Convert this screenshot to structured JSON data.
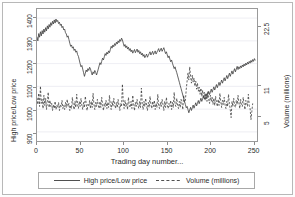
{
  "chart_data": {
    "type": "line",
    "title": "",
    "xlabel": "Trading day number...",
    "ylabel": "High price/Low price",
    "y2label": "Volume (millions)",
    "xlim": [
      0,
      255
    ],
    "ylim": [
      860,
      1440
    ],
    "y2lim": [
      0,
      26
    ],
    "grid": true,
    "grid_axis": "y",
    "legend_position": "bottom",
    "xticks": [
      "0",
      "50",
      "100",
      "150",
      "200",
      "250"
    ],
    "xtick_values": [
      0,
      50,
      100,
      150,
      200,
      250
    ],
    "yticks": [
      "900",
      "1000",
      "1100",
      "1200",
      "1300",
      "1400"
    ],
    "ytick_values": [
      900,
      1000,
      1100,
      1200,
      1300,
      1400
    ],
    "y2ticks": [
      "5",
      "11",
      "22.5"
    ],
    "y2tick_values": [
      5,
      11,
      22.5
    ],
    "series": [
      {
        "name": "High price/Low price",
        "axis": "left",
        "style": "solid",
        "color": "#3c3c3c",
        "values": [
          1318,
          1300,
          1332,
          1316,
          1340,
          1322,
          1345,
          1330,
          1352,
          1338,
          1358,
          1344,
          1366,
          1352,
          1372,
          1360,
          1380,
          1368,
          1386,
          1374,
          1392,
          1378,
          1396,
          1384,
          1390,
          1376,
          1382,
          1368,
          1374,
          1358,
          1364,
          1348,
          1352,
          1336,
          1330,
          1316,
          1322,
          1306,
          1290,
          1276,
          1282,
          1268,
          1274,
          1258,
          1264,
          1250,
          1256,
          1240,
          1232,
          1216,
          1200,
          1186,
          1192,
          1176,
          1160,
          1144,
          1158,
          1172,
          1164,
          1178,
          1170,
          1184,
          1176,
          1162,
          1150,
          1164,
          1156,
          1170,
          1162,
          1150,
          1162,
          1176,
          1190,
          1204,
          1196,
          1210,
          1224,
          1216,
          1230,
          1244,
          1236,
          1250,
          1242,
          1256,
          1248,
          1262,
          1276,
          1268,
          1282,
          1274,
          1288,
          1280,
          1294,
          1286,
          1300,
          1292,
          1306,
          1298,
          1312,
          1304,
          1290,
          1276,
          1284,
          1270,
          1278,
          1264,
          1272,
          1258,
          1266,
          1252,
          1260,
          1246,
          1254,
          1262,
          1248,
          1256,
          1264,
          1250,
          1258,
          1244,
          1252,
          1238,
          1246,
          1232,
          1240,
          1226,
          1234,
          1242,
          1228,
          1236,
          1244,
          1252,
          1238,
          1246,
          1254,
          1240,
          1248,
          1256,
          1242,
          1250,
          1258,
          1266,
          1252,
          1260,
          1268,
          1254,
          1262,
          1270,
          1256,
          1244,
          1252,
          1238,
          1226,
          1234,
          1220,
          1208,
          1216,
          1202,
          1190,
          1178,
          1186,
          1172,
          1160,
          1146,
          1132,
          1118,
          1104,
          1090,
          1076,
          1062,
          1048,
          1034,
          1020,
          1006,
          1012,
          998,
          984,
          996,
          1008,
          994,
          1006,
          1018,
          1004,
          1016,
          1028,
          1014,
          1026,
          1038,
          1024,
          1036,
          1048,
          1034,
          1046,
          1058,
          1044,
          1056,
          1068,
          1054,
          1066,
          1078,
          1064,
          1076,
          1088,
          1074,
          1086,
          1098,
          1084,
          1096,
          1108,
          1094,
          1106,
          1118,
          1104,
          1116,
          1128,
          1114,
          1126,
          1138,
          1124,
          1136,
          1148,
          1134,
          1146,
          1158,
          1144,
          1156,
          1168,
          1154,
          1166,
          1178,
          1164,
          1176,
          1188,
          1174,
          1186,
          1178,
          1190,
          1182,
          1194,
          1186,
          1198,
          1190,
          1202,
          1194,
          1206,
          1198,
          1210,
          1202,
          1214,
          1206,
          1218,
          1210,
          1222,
          1214
        ]
      },
      {
        "name": "Volume (millions)",
        "axis": "right",
        "style": "dashed",
        "color": "#3c3c3c",
        "values": [
          8.5,
          7.2,
          9.4,
          6.8,
          10.8,
          7.4,
          8.2,
          6.4,
          9.0,
          7.0,
          8.4,
          6.2,
          7.8,
          9.6,
          6.6,
          8.0,
          6.8,
          7.4,
          6.0,
          7.2,
          6.4,
          7.8,
          6.2,
          7.0,
          6.6,
          7.6,
          6.0,
          7.2,
          6.8,
          8.0,
          6.4,
          7.0,
          6.2,
          7.6,
          6.6,
          8.2,
          6.8,
          7.4,
          6.0,
          7.0,
          6.4,
          8.6,
          7.0,
          6.2,
          7.8,
          6.6,
          9.2,
          7.2,
          6.4,
          7.8,
          6.8,
          8.4,
          7.0,
          6.2,
          7.6,
          6.6,
          8.8,
          7.4,
          6.0,
          7.2,
          6.8,
          8.0,
          6.4,
          7.8,
          6.6,
          9.4,
          7.2,
          6.2,
          7.6,
          6.8,
          8.2,
          7.0,
          6.4,
          7.8,
          6.6,
          8.6,
          7.2,
          6.0,
          7.4,
          6.8,
          8.0,
          6.4,
          7.6,
          6.6,
          9.0,
          7.0,
          6.2,
          7.8,
          6.8,
          8.4,
          7.2,
          6.4,
          7.6,
          6.6,
          8.2,
          7.0,
          6.0,
          7.4,
          6.8,
          11.2,
          7.6,
          6.4,
          8.0,
          6.8,
          7.4,
          6.2,
          8.6,
          7.0,
          6.6,
          7.8,
          6.4,
          9.0,
          7.2,
          6.0,
          7.6,
          6.8,
          8.2,
          7.0,
          6.4,
          7.8,
          6.6,
          10.4,
          7.4,
          6.2,
          7.8,
          6.8,
          8.4,
          7.0,
          6.0,
          7.6,
          6.6,
          8.8,
          7.2,
          6.4,
          7.8,
          6.8,
          8.0,
          6.2,
          7.4,
          6.6,
          9.2,
          7.0,
          6.4,
          7.6,
          6.8,
          8.2,
          7.2,
          6.0,
          7.8,
          6.6,
          8.6,
          7.0,
          6.4,
          7.4,
          6.8,
          8.0,
          6.2,
          7.6,
          6.6,
          9.6,
          7.2,
          6.8,
          8.4,
          7.0,
          6.4,
          7.8,
          6.6,
          8.2,
          7.4,
          6.2,
          9.0,
          7.6,
          8.0,
          10.2,
          11.8,
          13.4,
          12.0,
          14.6,
          12.8,
          11.4,
          13.0,
          11.6,
          12.4,
          10.8,
          11.8,
          10.2,
          11.4,
          9.8,
          10.6,
          9.2,
          10.4,
          8.8,
          10.0,
          8.4,
          9.6,
          8.0,
          9.2,
          7.8,
          9.8,
          8.2,
          7.4,
          9.0,
          7.8,
          8.6,
          7.2,
          8.4,
          7.0,
          8.8,
          7.6,
          6.8,
          8.2,
          7.0,
          9.4,
          7.8,
          6.6,
          8.0,
          7.2,
          8.6,
          7.0,
          6.4,
          7.8,
          6.8,
          9.2,
          7.4,
          6.2,
          4.6,
          7.8,
          6.8,
          8.4,
          7.0,
          6.6,
          8.0,
          7.2,
          9.0,
          7.6,
          6.4,
          8.2,
          7.0,
          6.8,
          8.6,
          7.4,
          6.2,
          8.0,
          7.6,
          6.8,
          9.2,
          7.0,
          6.4,
          4.2,
          5.8,
          7.4
        ]
      }
    ]
  },
  "legend": {
    "entries": [
      {
        "label": "High price/Low price",
        "style": "solid"
      },
      {
        "label": "Volume (millions)",
        "style": "dashed"
      }
    ]
  },
  "axes": {
    "left_title": "High price/Low price",
    "right_title": "Volume (millions)",
    "x_title": "Trading day number..."
  },
  "colors": {
    "line": "#3c3c3c",
    "grid": "#e6e6ee",
    "frame": "#9a9a9a",
    "outer_frame": "#b8b8b8",
    "text": "#2b2b2b"
  }
}
